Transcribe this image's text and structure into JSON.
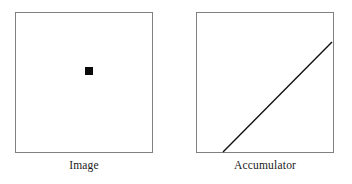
{
  "figure": {
    "width": 352,
    "height": 184,
    "background_color": "#ffffff",
    "panels": [
      {
        "id": "image",
        "caption": "Image",
        "border_color": "#808080",
        "fill_color": "#ffffff",
        "content_type": "point-marker",
        "marker": {
          "name": "black-square-point",
          "color": "#0a0a0a",
          "size_px": 8,
          "position_px": {
            "x": 89,
            "y": 70
          },
          "normalized_position": {
            "x": 0.54,
            "y": 0.42
          }
        }
      },
      {
        "id": "accumulator",
        "caption": "Accumulator",
        "border_color": "#808080",
        "fill_color": "#ffffff",
        "content_type": "diagonal-line",
        "line": {
          "name": "sinusoid-accumulator-curve",
          "color": "#111111",
          "stroke_width": 1.4,
          "start_px": {
            "x": 223,
            "y": 152
          },
          "end_px": {
            "x": 332,
            "y": 42
          }
        }
      }
    ]
  },
  "chart_data": {
    "type": "scatter",
    "title": "",
    "panels": [
      {
        "name": "Image",
        "type": "scatter",
        "xlabel": "",
        "ylabel": "",
        "xlim": [
          0,
          1
        ],
        "ylim": [
          0,
          1
        ],
        "grid": false,
        "points": [
          {
            "x": 0.54,
            "y": 0.58
          }
        ],
        "annotations": []
      },
      {
        "name": "Accumulator",
        "type": "line",
        "xlabel": "",
        "ylabel": "",
        "xlim": [
          0,
          1
        ],
        "ylim": [
          0,
          1
        ],
        "grid": false,
        "x": [
          0.2,
          1.0
        ],
        "values": [
          0.0,
          0.79
        ],
        "annotations": []
      }
    ],
    "legend": [],
    "legend_position": "none"
  }
}
